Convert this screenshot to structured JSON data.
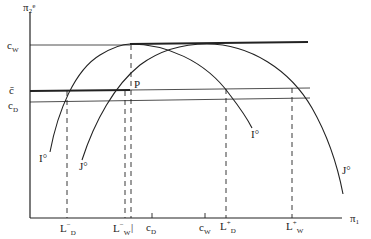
{
  "axes": {
    "y_label": "π₂ᵉ",
    "x_label": "π₁"
  },
  "y_ticks": [
    {
      "id": "cW",
      "text": "c",
      "sub": "W"
    },
    {
      "id": "cbar",
      "text": "c̄",
      "sub": ""
    },
    {
      "id": "cD",
      "text": "c",
      "sub": "D"
    }
  ],
  "x_ticks": [
    {
      "id": "LDm",
      "text": "L",
      "sub": "D",
      "sup": "−"
    },
    {
      "id": "LWm",
      "text": "L",
      "sub": "W",
      "sup": "−"
    },
    {
      "id": "bar",
      "text": "|",
      "sub": "",
      "sup": ""
    },
    {
      "id": "cD",
      "text": "c",
      "sub": "D",
      "sup": ""
    },
    {
      "id": "cW",
      "text": "c",
      "sub": "W",
      "sup": ""
    },
    {
      "id": "LDp",
      "text": "L",
      "sub": "D",
      "sup": "+"
    },
    {
      "id": "LWp",
      "text": "L",
      "sub": "W",
      "sup": "+"
    }
  ],
  "curve_labels": {
    "I_left": "I°",
    "J_left": "J°",
    "I_right": "I°",
    "J_right": "J°"
  },
  "point_label": "P",
  "colors": {
    "ink": "#222222",
    "background": "#ffffff"
  }
}
